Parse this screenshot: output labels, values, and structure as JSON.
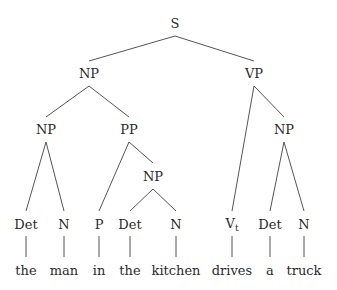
{
  "diagram": {
    "type": "syntax-tree",
    "sentence": "the man in the kitchen drives a truck",
    "nodes": {
      "s": {
        "label": "S",
        "x": 175,
        "y": 23
      },
      "np_subj": {
        "label": "NP",
        "x": 89,
        "y": 73
      },
      "vp": {
        "label": "VP",
        "x": 254,
        "y": 73
      },
      "np_inner": {
        "label": "NP",
        "x": 46,
        "y": 128
      },
      "pp": {
        "label": "PP",
        "x": 129,
        "y": 128
      },
      "np_obj": {
        "label": "NP",
        "x": 284,
        "y": 128
      },
      "np_pp": {
        "label": "NP",
        "x": 153,
        "y": 175
      },
      "det1": {
        "label": "Det",
        "x": 26,
        "y": 224
      },
      "n1": {
        "label": "N",
        "x": 64,
        "y": 224
      },
      "p": {
        "label": "P",
        "x": 99,
        "y": 224
      },
      "det2": {
        "label": "Det",
        "x": 130,
        "y": 224
      },
      "n2": {
        "label": "N",
        "x": 176,
        "y": 224
      },
      "vt": {
        "label": "V",
        "sub": "t",
        "x": 232,
        "y": 224
      },
      "det3": {
        "label": "Det",
        "x": 270,
        "y": 224
      },
      "n3": {
        "label": "N",
        "x": 304,
        "y": 224
      }
    },
    "words": [
      {
        "text": "the",
        "x": 26
      },
      {
        "text": "man",
        "x": 64
      },
      {
        "text": "in",
        "x": 99
      },
      {
        "text": "the",
        "x": 130
      },
      {
        "text": "kitchen",
        "x": 176
      },
      {
        "text": "drives",
        "x": 232
      },
      {
        "text": "a",
        "x": 270
      },
      {
        "text": "truck",
        "x": 304
      }
    ],
    "edges": [
      [
        "s",
        "np_subj"
      ],
      [
        "s",
        "vp"
      ],
      [
        "np_subj",
        "np_inner"
      ],
      [
        "np_subj",
        "pp"
      ],
      [
        "np_inner",
        "det1"
      ],
      [
        "np_inner",
        "n1"
      ],
      [
        "pp",
        "p"
      ],
      [
        "pp",
        "np_pp"
      ],
      [
        "np_pp",
        "det2"
      ],
      [
        "np_pp",
        "n2"
      ],
      [
        "vp",
        "vt"
      ],
      [
        "vp",
        "np_obj"
      ],
      [
        "np_obj",
        "det3"
      ],
      [
        "np_obj",
        "n3"
      ]
    ]
  }
}
